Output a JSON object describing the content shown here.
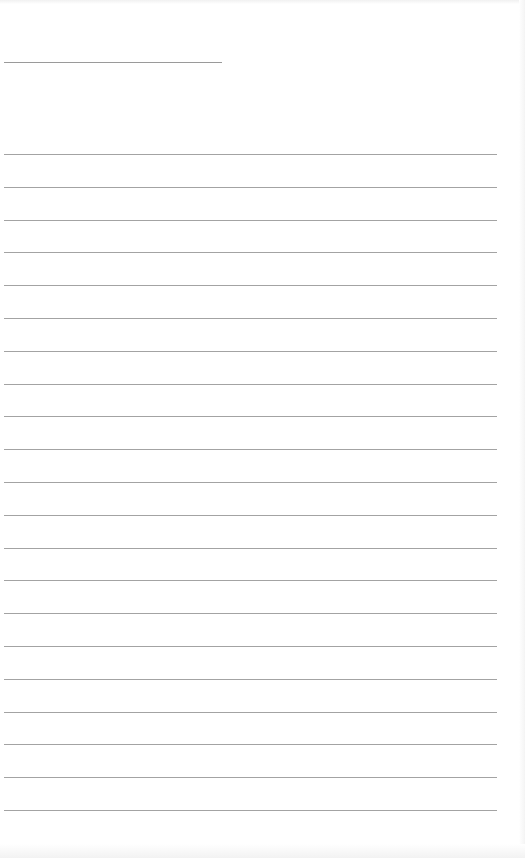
{
  "page": {
    "type": "blank ruled sheet",
    "title_line": {
      "x": 4,
      "y": 62,
      "width": 218
    },
    "ruled_lines": {
      "count": 21,
      "first_y": 154,
      "spacing": 32.8,
      "x": 4,
      "width": 493
    },
    "colors": {
      "background": "#ffffff",
      "line": "#a3a3a3",
      "title_line": "#9a9a9a"
    }
  }
}
